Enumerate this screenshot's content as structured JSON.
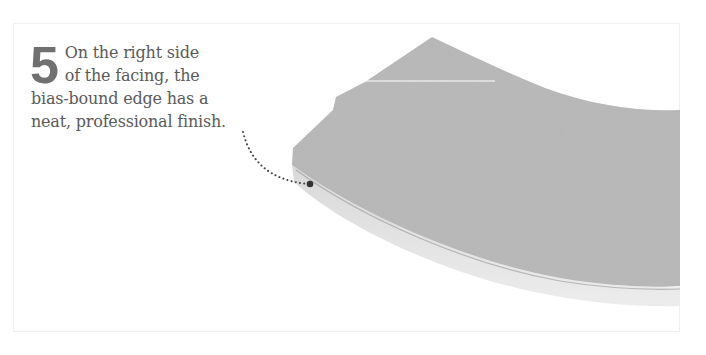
{
  "step": {
    "number": "5",
    "lines": [
      "On the right side",
      "of the facing, the",
      "bias-bound edge has a",
      "neat, professional finish."
    ]
  },
  "illustration": {
    "subject": "curved facing with bias-bound edge",
    "fabric_color": "#b9b9b9",
    "binding_color": "#e6e6e6",
    "leader_color": "#444444"
  }
}
